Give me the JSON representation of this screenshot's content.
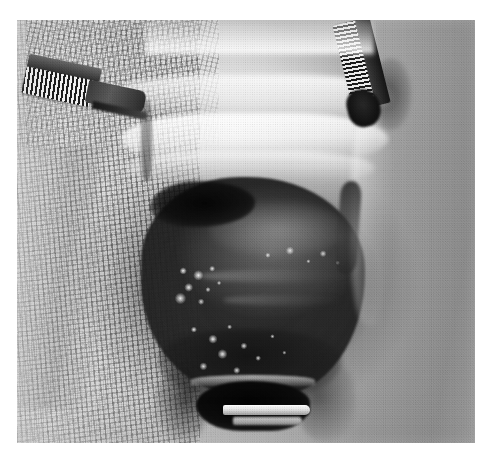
{
  "figure": {
    "domain": "Natural-Image",
    "kind": "clinical-surgical-photograph",
    "color_mode": "grayscale / black-and-white halftone print",
    "caption": "",
    "canvas": {
      "width_px": 489,
      "height_px": 461,
      "background": "#ffffff"
    },
    "plate": {
      "left_px": 17,
      "top_px": 20,
      "width_px": 458,
      "height_px": 423,
      "border": "white page margin on all sides",
      "alt_text": "Black and white intraoperative photograph of a surgical field: the wound is held open by gauze packing and metal retractors, exposing a dark rounded tissue mass speckled with bright white fibrinous exudate, with a metallic retractor blade at the lower edge."
    },
    "palette": {
      "page_white": "#ffffff",
      "gauze_light": "#d6d6d6",
      "gauze_mid": "#b0b0b0",
      "gauze_dark": "#8d8d8d",
      "tissue_highlight": "#fcfcfc",
      "mass_mid": "#4a4a4a",
      "mass_dark": "#262626",
      "cavity_black": "#070707",
      "instrument_steel_light": "#f2f2f2",
      "instrument_steel_dark": "#1c1c1c"
    },
    "regions": [
      {
        "name": "gauze-drape-left",
        "label": "Left gauze drape",
        "description": "Pale open-weave surgical gauze filling the left third, woven grid texture, soft folds.",
        "tone": "light"
      },
      {
        "name": "gauze-drape-left-upper",
        "label": "Upper-left gauze fold",
        "description": "Diagonally oriented denser weave band across the top-left corner.",
        "tone": "light-mid"
      },
      {
        "name": "gauze-drape-right",
        "label": "Right gauze drape",
        "description": "Darker, more strongly printed gauze weave occupying the right third with a vertical fold.",
        "tone": "mid-dark"
      },
      {
        "name": "retracted-tissue-bands",
        "label": "Retracted tissue bands",
        "description": "Two bright, near-white horizontal bands of retracted tissue across the upper middle of the field.",
        "tone": "highlight"
      },
      {
        "name": "central-mass",
        "label": "Exposed tissue mass",
        "description": "Large rounded dark mass occupying the centre of the wound, smooth domed upper surface with a specular sheen.",
        "tone": "dark"
      },
      {
        "name": "dark-notch",
        "label": "Dark recess at mass apex",
        "description": "Near-black wedge-shaped crevice at the upper-left margin of the mass.",
        "tone": "black"
      },
      {
        "name": "fibrin-exudate",
        "label": "White fibrinous exudate",
        "description": "Irregular bright white speckles and plaques scattered over the lower-left face of the mass.",
        "tone": "highlight"
      },
      {
        "name": "wound-slit-right",
        "label": "Dark wound slit",
        "description": "Narrow dark elongated slit along the right margin of the exposed mass.",
        "tone": "dark"
      },
      {
        "name": "retractor-cavity",
        "label": "Deep cavity below mass",
        "description": "Black cavity at the bottom centre bounded by a reflective metal retractor blade.",
        "tone": "black"
      }
    ],
    "instruments": [
      {
        "name": "instrument-upper-left",
        "label": "Ribbed surgical instrument (upper left)",
        "description": "Serrated/ribbed steel shaft entering from the upper-left corner, angled down-right, with a dark flattened tip.",
        "orientation_deg": 12
      },
      {
        "name": "instrument-upper-right",
        "label": "Ribbed surgical instrument (upper right)",
        "description": "Serrated/ribbed steel shaft descending from the top edge right of centre, ending in a dark tip.",
        "orientation_deg": -14
      },
      {
        "name": "retractor-blade-bottom",
        "label": "Metal retractor blade (bottom)",
        "description": "Curved, brightly reflective metal retractor blade spanning the lower centre of the wound.",
        "orientation_deg": 0
      }
    ]
  }
}
